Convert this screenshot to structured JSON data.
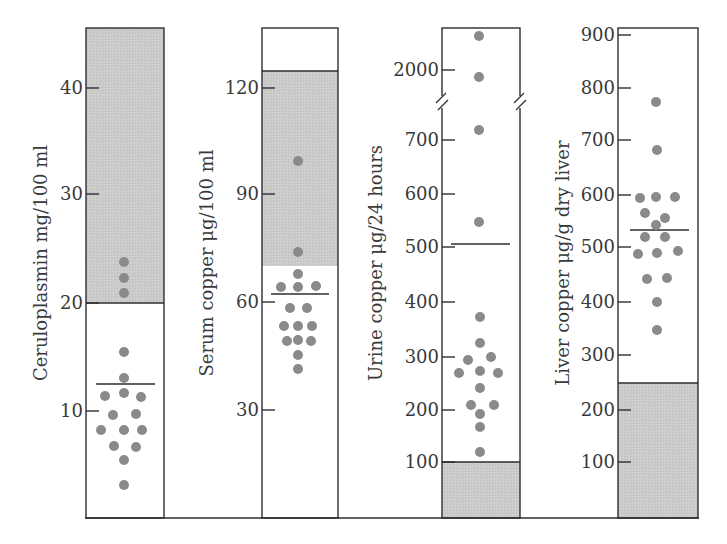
{
  "chart_data": [
    {
      "type": "scatter",
      "subtype": "dot-strip",
      "title": "",
      "ylabel": "Ceruloplasmin mg/100 ml",
      "yticks": [
        10,
        20,
        30,
        40
      ],
      "ylim": [
        0,
        45.5
      ],
      "normal_range": [
        20,
        45.5
      ],
      "mean": 12.5,
      "points": [
        23.8,
        22.4,
        20.9,
        15.4,
        13.0,
        11.6,
        11.2,
        11.2,
        9.6,
        9.6,
        8.2,
        8.2,
        8.2,
        6.7,
        6.7,
        5.4,
        3.1
      ],
      "grid": false,
      "box": {
        "x0": 86,
        "x1": 164,
        "y_top": 28,
        "y_zero": 518,
        "px_per_unit": 10.76
      }
    },
    {
      "type": "scatter",
      "subtype": "dot-strip",
      "ylabel": "Serum copper μg/100 ml",
      "yticks": [
        30,
        60,
        90,
        120
      ],
      "ylim": [
        0,
        136
      ],
      "normal_range": [
        70,
        125
      ],
      "mean": 62.5,
      "points": [
        99.5,
        74,
        68,
        65,
        65,
        65,
        58.5,
        58.5,
        53.5,
        53.5,
        53.5,
        49.5,
        49.5,
        49.5,
        45.5,
        41.5
      ],
      "grid": false,
      "box": {
        "x0": 262,
        "x1": 338,
        "y_top": 28,
        "y_zero": 518,
        "px_per_unit": 3.6
      }
    },
    {
      "type": "scatter",
      "subtype": "dot-strip",
      "ylabel": "Urine copper μg/24 hours",
      "yticks": [
        100,
        200,
        300,
        400,
        500,
        600,
        700,
        2000
      ],
      "ylim": [
        0,
        2150
      ],
      "axis_break": "between 700 and 2000",
      "normal_range": [
        0,
        100
      ],
      "mean": 510,
      "points": [
        2150,
        1900,
        720,
        550,
        375,
        325,
        300,
        295,
        270,
        270,
        270,
        240,
        210,
        210,
        195,
        170,
        120
      ],
      "grid": false,
      "box": {
        "x0": 442,
        "x1": 520,
        "y_top": 28,
        "y_zero": 518
      }
    },
    {
      "type": "scatter",
      "subtype": "dot-strip",
      "ylabel": "Liver copper μg/g dry liver",
      "yticks": [
        100,
        200,
        300,
        400,
        500,
        600,
        700,
        800,
        900
      ],
      "ylim": [
        0,
        920
      ],
      "normal_range": [
        0,
        250
      ],
      "mean": 530,
      "points": [
        770,
        680,
        595,
        595,
        595,
        565,
        555,
        540,
        515,
        515,
        490,
        490,
        490,
        445,
        445,
        400,
        345
      ],
      "grid": false,
      "box": {
        "x0": 618,
        "x1": 698,
        "y_top": 28,
        "y_zero": 518,
        "px_per_unit": 0.535
      }
    }
  ],
  "panels": [
    {
      "ylabel": "Ceruloplasmin mg/100 ml",
      "ticks": [
        {
          "label": "40",
          "y": 88
        },
        {
          "label": "30",
          "y": 194
        },
        {
          "label": "20",
          "y": 303
        },
        {
          "label": "10",
          "y": 411
        }
      ],
      "x0": 86,
      "x1": 164,
      "gray": {
        "y0": 28,
        "y1": 303
      },
      "mean_y": 384,
      "mean_x0": 96,
      "mean_x1": 155,
      "dots": [
        {
          "x": 124,
          "y": 262
        },
        {
          "x": 124,
          "y": 278
        },
        {
          "x": 124,
          "y": 293
        },
        {
          "x": 124,
          "y": 352
        },
        {
          "x": 124,
          "y": 378
        },
        {
          "x": 105,
          "y": 396
        },
        {
          "x": 124,
          "y": 393
        },
        {
          "x": 141,
          "y": 397
        },
        {
          "x": 113,
          "y": 415
        },
        {
          "x": 136,
          "y": 414
        },
        {
          "x": 101,
          "y": 430
        },
        {
          "x": 124,
          "y": 430
        },
        {
          "x": 142,
          "y": 430
        },
        {
          "x": 114,
          "y": 446
        },
        {
          "x": 136,
          "y": 447
        },
        {
          "x": 124,
          "y": 460
        },
        {
          "x": 124,
          "y": 485
        }
      ]
    },
    {
      "ylabel": "Serum copper μg/100 ml",
      "ticks": [
        {
          "label": "120",
          "y": 88
        },
        {
          "label": "90",
          "y": 194
        },
        {
          "label": "60",
          "y": 302
        },
        {
          "label": "30",
          "y": 410
        }
      ],
      "x0": 262,
      "x1": 338,
      "gray": {
        "y0": 71,
        "y1": 266
      },
      "mean_y": 294,
      "mean_x0": 271,
      "mean_x1": 329,
      "dots": [
        {
          "x": 298,
          "y": 161
        },
        {
          "x": 298,
          "y": 252
        },
        {
          "x": 298,
          "y": 274
        },
        {
          "x": 281,
          "y": 287
        },
        {
          "x": 298,
          "y": 287
        },
        {
          "x": 316,
          "y": 286
        },
        {
          "x": 290,
          "y": 308
        },
        {
          "x": 307,
          "y": 308
        },
        {
          "x": 284,
          "y": 326
        },
        {
          "x": 298,
          "y": 326
        },
        {
          "x": 312,
          "y": 326
        },
        {
          "x": 287,
          "y": 341
        },
        {
          "x": 298,
          "y": 340
        },
        {
          "x": 311,
          "y": 341
        },
        {
          "x": 298,
          "y": 355
        },
        {
          "x": 298,
          "y": 369
        }
      ]
    },
    {
      "ylabel": "Urine copper μg/24 hours",
      "ticks": [
        {
          "label": "2000",
          "y": 70
        },
        {
          "label": "700",
          "y": 140
        },
        {
          "label": "600",
          "y": 194
        },
        {
          "label": "500",
          "y": 247
        },
        {
          "label": "400",
          "y": 302
        },
        {
          "label": "300",
          "y": 357
        },
        {
          "label": "200",
          "y": 410
        },
        {
          "label": "100",
          "y": 462
        }
      ],
      "x0": 442,
      "x1": 520,
      "gray": {
        "y0": 462,
        "y1": 518
      },
      "mean_y": 244,
      "mean_x0": 451,
      "mean_x1": 510,
      "break_y": 102,
      "dots": [
        {
          "x": 479,
          "y": 36
        },
        {
          "x": 479,
          "y": 77
        },
        {
          "x": 479,
          "y": 130
        },
        {
          "x": 479,
          "y": 222
        },
        {
          "x": 480,
          "y": 317
        },
        {
          "x": 480,
          "y": 343
        },
        {
          "x": 468,
          "y": 360
        },
        {
          "x": 491,
          "y": 357
        },
        {
          "x": 459,
          "y": 373
        },
        {
          "x": 480,
          "y": 371
        },
        {
          "x": 498,
          "y": 373
        },
        {
          "x": 480,
          "y": 388
        },
        {
          "x": 471,
          "y": 405
        },
        {
          "x": 494,
          "y": 405
        },
        {
          "x": 480,
          "y": 414
        },
        {
          "x": 480,
          "y": 427
        },
        {
          "x": 480,
          "y": 452
        }
      ]
    },
    {
      "ylabel": "Liver copper μg/g dry liver",
      "ticks": [
        {
          "label": "900",
          "y": 35
        },
        {
          "label": "800",
          "y": 88
        },
        {
          "label": "700",
          "y": 140
        },
        {
          "label": "600",
          "y": 195
        },
        {
          "label": "500",
          "y": 247
        },
        {
          "label": "400",
          "y": 302
        },
        {
          "label": "300",
          "y": 355
        },
        {
          "label": "200",
          "y": 410
        },
        {
          "label": "100",
          "y": 462
        }
      ],
      "x0": 618,
      "x1": 698,
      "gray": {
        "y0": 383,
        "y1": 518
      },
      "mean_y": 230,
      "mean_x0": 630,
      "mean_x1": 689,
      "dots": [
        {
          "x": 656,
          "y": 102
        },
        {
          "x": 657,
          "y": 150
        },
        {
          "x": 640,
          "y": 198
        },
        {
          "x": 656,
          "y": 197
        },
        {
          "x": 675,
          "y": 197
        },
        {
          "x": 645,
          "y": 213
        },
        {
          "x": 665,
          "y": 218
        },
        {
          "x": 656,
          "y": 225
        },
        {
          "x": 645,
          "y": 237
        },
        {
          "x": 665,
          "y": 237
        },
        {
          "x": 638,
          "y": 254
        },
        {
          "x": 657,
          "y": 253
        },
        {
          "x": 678,
          "y": 251
        },
        {
          "x": 647,
          "y": 279
        },
        {
          "x": 667,
          "y": 278
        },
        {
          "x": 657,
          "y": 302
        },
        {
          "x": 657,
          "y": 330
        }
      ]
    }
  ],
  "layout": {
    "baseline_y": 518,
    "baseline_x0": 86,
    "baseline_x1": 699,
    "box_top": 28,
    "colors": {
      "shade": "#c9c9c9",
      "dot": "#8a8a8a",
      "line": "#2e2e2e",
      "text": "#3a3a3a"
    }
  }
}
